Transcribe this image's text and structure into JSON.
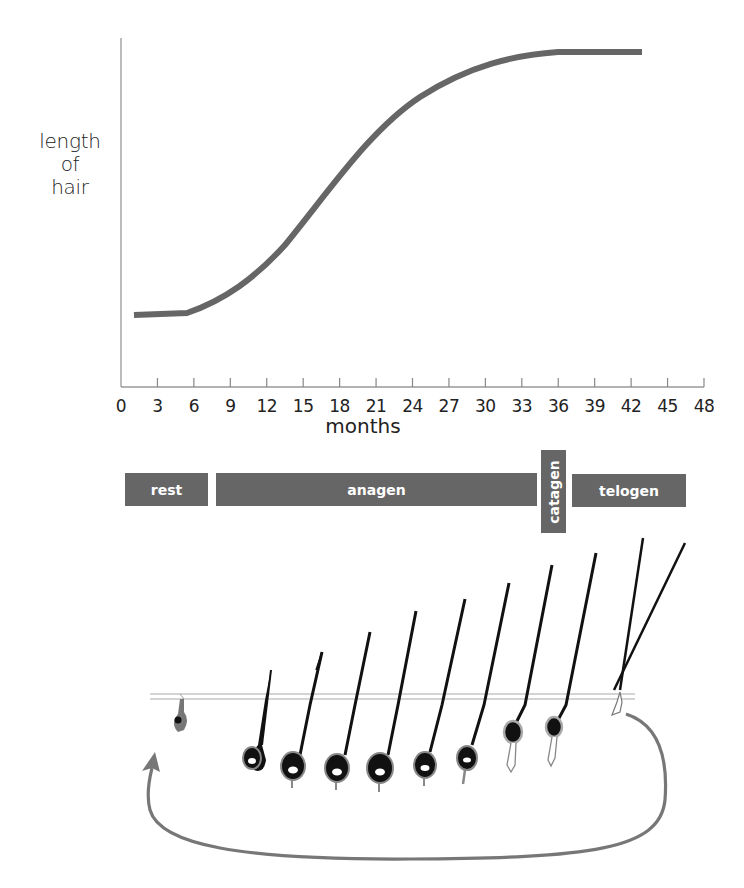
{
  "chart_data": {
    "type": "line",
    "title": "",
    "xlabel": "months",
    "ylabel": "length of hair",
    "ylabel_lines": [
      "length",
      "of",
      "hair"
    ],
    "xlim": [
      0,
      48
    ],
    "x_ticks": [
      0,
      3,
      6,
      9,
      12,
      15,
      18,
      21,
      24,
      27,
      30,
      33,
      36,
      39,
      42,
      45,
      48
    ],
    "y_ticks": [],
    "grid": false,
    "legend": null,
    "series": [
      {
        "name": "hair length",
        "color": "#666666",
        "x": [
          1,
          3,
          5.5,
          8,
          10,
          12,
          14,
          16,
          18,
          20,
          22,
          24,
          26,
          28,
          30,
          32,
          34,
          36,
          39,
          43
        ],
        "y_relative": [
          0.0,
          0.0,
          0.01,
          0.05,
          0.1,
          0.17,
          0.25,
          0.34,
          0.43,
          0.52,
          0.61,
          0.69,
          0.77,
          0.84,
          0.9,
          0.95,
          0.98,
          1.0,
          1.0,
          1.0
        ]
      }
    ],
    "annotations": [
      {
        "type": "phase",
        "label": "rest",
        "start_month": 0.5,
        "end_month": 7.3
      },
      {
        "type": "phase",
        "label": "anagen",
        "start_month": 7.8,
        "end_month": 34.2
      },
      {
        "type": "phase",
        "label": "catagen",
        "start_month": 34.6,
        "end_month": 36.6,
        "orientation": "vertical"
      },
      {
        "type": "phase",
        "label": "telogen",
        "start_month": 37.1,
        "end_month": 46.5
      }
    ]
  },
  "axis": {
    "ylabel_lines": [
      "length",
      "of",
      "hair"
    ],
    "xlabel": "months",
    "ticks": [
      "0",
      "3",
      "6",
      "9",
      "12",
      "15",
      "18",
      "21",
      "24",
      "27",
      "30",
      "33",
      "36",
      "39",
      "42",
      "45",
      "48"
    ]
  },
  "phases": {
    "rest": "rest",
    "anagen": "anagen",
    "catagen": "catagen",
    "telogen": "telogen"
  },
  "colors": {
    "curve": "#666666",
    "phase_bar": "#666666",
    "phase_text": "#ffffff",
    "axis": "#888888",
    "hair": "#111111",
    "cycle_arrow": "#777777"
  },
  "illustration": {
    "description": "hair follicle growth cycle",
    "stages": [
      "rest",
      "anagen",
      "anagen",
      "anagen",
      "anagen",
      "anagen",
      "anagen",
      "catagen",
      "catagen",
      "telogen"
    ],
    "cycle_arrow": "loop from telogen back to rest"
  }
}
